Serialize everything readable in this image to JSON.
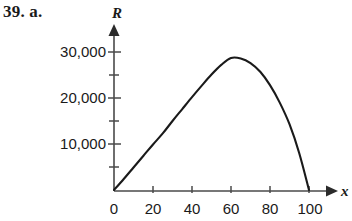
{
  "problem": {
    "label": "39. a."
  },
  "figure": {
    "axis_color": "#4a4a4a",
    "curve_color": "#1a1a1a",
    "background": "#ffffff"
  },
  "chart_data": {
    "type": "line",
    "title": "",
    "subtitle": "",
    "xlabel": "x",
    "ylabel": "R",
    "xlim": [
      0,
      105
    ],
    "ylim": [
      0,
      32500
    ],
    "grid": false,
    "legend": null,
    "x_ticks_major": [
      0,
      20,
      40,
      60,
      80,
      100
    ],
    "x_tick_labels": [
      "0",
      "20",
      "40",
      "60",
      "80",
      "100"
    ],
    "y_ticks_major": [
      10000,
      20000,
      30000
    ],
    "y_tick_labels": [
      "10,000",
      "20,000",
      "30,000"
    ],
    "y_ticks_minor": [
      5000,
      15000,
      25000
    ],
    "annotations": [],
    "series": [
      {
        "name": "R",
        "x": [
          0,
          5,
          10,
          15,
          20,
          25,
          30,
          35,
          40,
          45,
          50,
          55,
          60,
          65,
          70,
          75,
          80,
          85,
          90,
          95,
          100
        ],
        "values": [
          0,
          2400,
          4900,
          7400,
          9900,
          12300,
          15000,
          17600,
          20200,
          22700,
          25100,
          27200,
          28700,
          28600,
          27600,
          25700,
          22800,
          19000,
          14300,
          8000,
          0
        ]
      }
    ]
  }
}
